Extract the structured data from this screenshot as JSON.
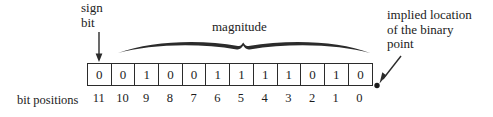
{
  "figure": {
    "background_color": "#ffffff",
    "ink_color": "#222222"
  },
  "annotations": {
    "sign_bit": {
      "line1": "sign",
      "line2": "bit",
      "points_to_bit_position": "11"
    },
    "magnitude": {
      "label": "magnitude",
      "spans_bit_positions": "10..0"
    },
    "implied_point": {
      "line1": "implied location",
      "line2": "of the binary",
      "line3": "point"
    },
    "bit_positions_label": "bit positions"
  },
  "word": {
    "bit_count": 12,
    "bits": [
      "0",
      "0",
      "1",
      "0",
      "0",
      "1",
      "1",
      "1",
      "1",
      "0",
      "1",
      "0"
    ],
    "positions": [
      "11",
      "10",
      "9",
      "8",
      "7",
      "6",
      "5",
      "4",
      "3",
      "2",
      "1",
      "0"
    ]
  }
}
